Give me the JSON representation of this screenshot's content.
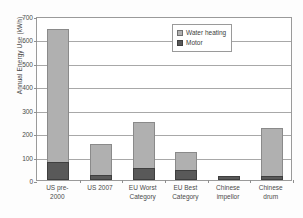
{
  "chart_data": {
    "type": "bar",
    "stacked": true,
    "title": "",
    "xlabel": "",
    "ylabel": "Annual Energy Use (kWh)",
    "ylim": [
      0,
      700
    ],
    "yticks": [
      0,
      100,
      200,
      300,
      400,
      500,
      600,
      700
    ],
    "ytick_labels": [
      "0",
      "100",
      "200",
      "300",
      "400",
      "500",
      "600",
      "700"
    ],
    "grid": "horizontal",
    "legend_position": "upper right",
    "categories": [
      "US pre-2000",
      "US 2007",
      "EU Worst Category",
      "EU Best Category",
      "Chinese impellor",
      "Chinese drum"
    ],
    "category_lines": [
      [
        "US pre-",
        "2000"
      ],
      [
        "US 2007",
        ""
      ],
      [
        "EU Worst",
        "Category"
      ],
      [
        "EU Best",
        "Category"
      ],
      [
        "Chinese",
        "impellor"
      ],
      [
        "Chinese",
        "drum"
      ]
    ],
    "series": [
      {
        "name": "Water heating",
        "color": "#b0b0b0",
        "values": [
          568,
          131,
          195,
          76,
          2,
          203
        ]
      },
      {
        "name": "Motor",
        "color": "#595959",
        "values": [
          77,
          22,
          52,
          44,
          18,
          17
        ]
      }
    ],
    "totals": [
      645,
      153,
      247,
      120,
      20,
      220
    ]
  },
  "legend": {
    "items": [
      {
        "label": "Water heating",
        "swatch": "water"
      },
      {
        "label": "Motor",
        "swatch": "motor"
      }
    ]
  }
}
